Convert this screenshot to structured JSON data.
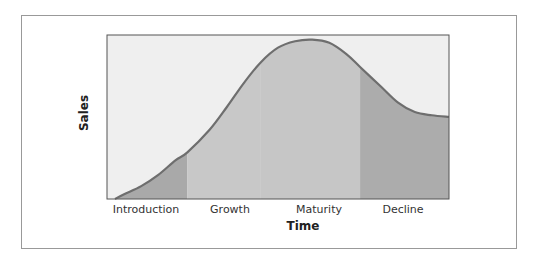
{
  "chart_data": {
    "type": "area",
    "title": "",
    "xlabel": "Time",
    "ylabel": "Sales",
    "stages": [
      {
        "name": "Introduction",
        "start": 0.0,
        "end": 0.235
      },
      {
        "name": "Growth",
        "start": 0.235,
        "end": 0.45
      },
      {
        "name": "Maturity",
        "start": 0.45,
        "end": 0.74
      },
      {
        "name": "Decline",
        "start": 0.74,
        "end": 1.0
      }
    ],
    "curve": {
      "x": [
        0.0,
        0.05,
        0.1,
        0.15,
        0.2,
        0.235,
        0.3,
        0.35,
        0.4,
        0.45,
        0.5,
        0.55,
        0.6,
        0.65,
        0.7,
        0.74,
        0.8,
        0.85,
        0.9,
        0.95,
        1.0
      ],
      "y": [
        0.0,
        0.03,
        0.08,
        0.15,
        0.24,
        0.29,
        0.43,
        0.57,
        0.72,
        0.85,
        0.94,
        0.98,
        0.99,
        0.97,
        0.9,
        0.82,
        0.7,
        0.6,
        0.54,
        0.52,
        0.51
      ]
    },
    "xlim": [
      0,
      1
    ],
    "ylim": [
      0,
      1
    ],
    "grid": false,
    "legend": "none",
    "colors": {
      "background": "#efefef",
      "introduction": "#a9a9a9",
      "growth": "#c8c8c8",
      "maturity": "#c6c6c6",
      "decline": "#acacac",
      "curve": "#6e6e6e",
      "axis": "#555555"
    }
  }
}
